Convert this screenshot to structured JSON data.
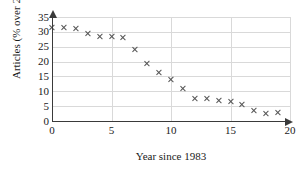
{
  "chart_data": {
    "type": "scatter",
    "title": "",
    "xlabel": "Year since 1983",
    "ylabel": "Articles (% over 25)",
    "xlim": [
      0,
      20
    ],
    "ylim": [
      0,
      35
    ],
    "grid": true,
    "legend": "none",
    "marker": "x",
    "marker_color": "#555555",
    "xticks": [
      0,
      5,
      10,
      15,
      20
    ],
    "yticks": [
      0,
      5,
      10,
      15,
      20,
      25,
      30,
      35
    ],
    "xtick_labels": [
      "0",
      "5",
      "10",
      "15",
      "20"
    ],
    "ytick_labels": [
      "0",
      "5",
      "10",
      "15",
      "20",
      "25",
      "30",
      "35"
    ],
    "x": [
      0,
      1,
      2,
      3,
      4,
      5,
      6,
      7,
      8,
      9,
      10,
      11,
      12,
      13,
      14,
      15,
      16,
      17,
      18,
      19
    ],
    "values": [
      31.5,
      31.5,
      31,
      29.5,
      28.5,
      28.5,
      28,
      24,
      19.5,
      16.5,
      14,
      11,
      7.5,
      7.5,
      7,
      6.5,
      5.5,
      3.5,
      2.5,
      3
    ]
  }
}
